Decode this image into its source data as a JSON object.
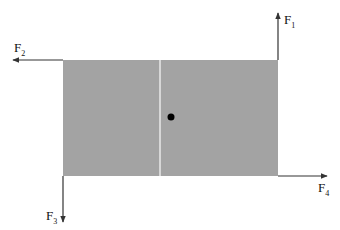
{
  "diagram": {
    "colors": {
      "plate": "#a3a3a3",
      "divider": "#e8e8e8",
      "arrow": "#333333",
      "dot": "#000000"
    },
    "forces": [
      {
        "name": "F",
        "subscript": "1",
        "direction": "up",
        "corner": "top-right"
      },
      {
        "name": "F",
        "subscript": "2",
        "direction": "left",
        "corner": "top-left"
      },
      {
        "name": "F",
        "subscript": "3",
        "direction": "down",
        "corner": "bottom-left"
      },
      {
        "name": "F",
        "subscript": "4",
        "direction": "right",
        "corner": "bottom-right"
      }
    ]
  }
}
